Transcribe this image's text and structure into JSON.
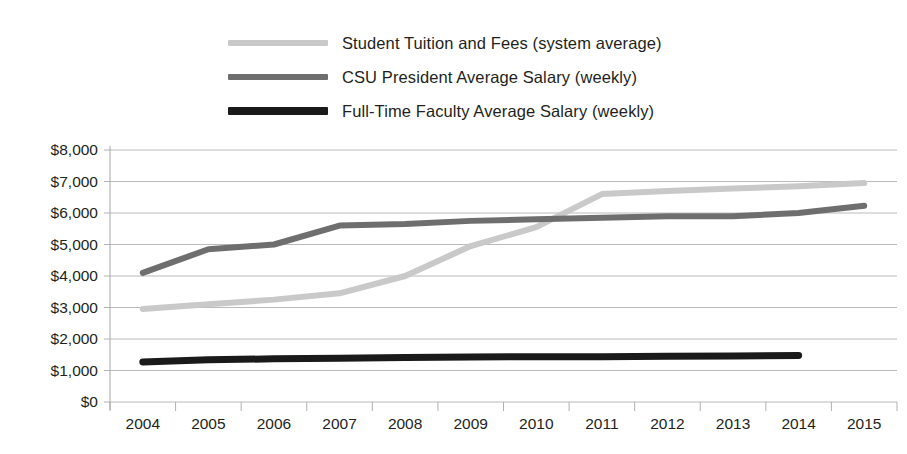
{
  "legend": {
    "position": "top",
    "items": [
      {
        "label": "Student Tuition and Fees (system average)",
        "color": "#c9c9c9",
        "swatch": "legend-swatch-tuition"
      },
      {
        "label": "CSU President Average Salary (weekly)",
        "color": "#6e6e6e",
        "swatch": "legend-swatch-president"
      },
      {
        "label": "Full-Time Faculty Average Salary (weekly)",
        "color": "#1a1a1a",
        "swatch": "legend-swatch-faculty"
      }
    ]
  },
  "axis": {
    "y_ticks": [
      "$8,000",
      "$7,000",
      "$6,000",
      "$5,000",
      "$4,000",
      "$3,000",
      "$2,000",
      "$1,000",
      "$0"
    ],
    "x_ticks": [
      "2004",
      "2005",
      "2006",
      "2007",
      "2008",
      "2009",
      "2010",
      "2011",
      "2012",
      "2013",
      "2014",
      "2015"
    ]
  },
  "chart_data": {
    "type": "line",
    "title": "",
    "subtitle": "",
    "xlabel": "",
    "ylabel": "",
    "categories": [
      "2004",
      "2005",
      "2006",
      "2007",
      "2008",
      "2009",
      "2010",
      "2011",
      "2012",
      "2013",
      "2014",
      "2015"
    ],
    "ylim": [
      0,
      8000
    ],
    "ytick_step": 1000,
    "ytick_labels": [
      "$0",
      "$1,000",
      "$2,000",
      "$3,000",
      "$4,000",
      "$5,000",
      "$6,000",
      "$7,000",
      "$8,000"
    ],
    "grid": true,
    "grid_axis": "y",
    "legend_position": "top",
    "currency": "USD",
    "series": [
      {
        "name": "Student Tuition and Fees (system average)",
        "color": "#c9c9c9",
        "line_width": 6,
        "values": [
          2950,
          3100,
          3250,
          3450,
          4000,
          4950,
          5550,
          6600,
          6700,
          6780,
          6850,
          6950
        ]
      },
      {
        "name": "CSU President Average Salary (weekly)",
        "color": "#6e6e6e",
        "line_width": 6,
        "values": [
          4100,
          4850,
          5000,
          5600,
          5650,
          5750,
          5800,
          5850,
          5900,
          5900,
          6000,
          6230
        ]
      },
      {
        "name": "Full-Time Faculty Average Salary (weekly)",
        "color": "#1a1a1a",
        "line_width": 7,
        "values": [
          1270,
          1340,
          1370,
          1390,
          1410,
          1430,
          1440,
          1440,
          1450,
          1460,
          1480,
          null
        ]
      }
    ]
  }
}
